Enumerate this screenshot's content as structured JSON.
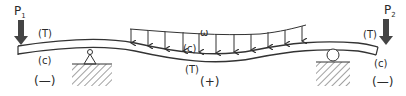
{
  "diagram": {
    "loads": {
      "p1": {
        "label": "P",
        "subscript": "1"
      },
      "p2": {
        "label": "P",
        "subscript": "2"
      },
      "w": {
        "label": "ω"
      }
    },
    "regions": {
      "left_overhang": {
        "top": "(T)",
        "bottom": "(c)",
        "sign": "(—)"
      },
      "midspan": {
        "top": "(c)",
        "bottom": "(T)",
        "sign": "(+)"
      },
      "right_overhang": {
        "top": "(T)",
        "bottom": "(c)",
        "sign": "(—)"
      }
    },
    "supports": {
      "left": "pin",
      "right": "roller"
    },
    "colors": {
      "ink": "#2a2a2a",
      "load_arrow": "#3a3a3a",
      "background": "#ffffff"
    }
  }
}
